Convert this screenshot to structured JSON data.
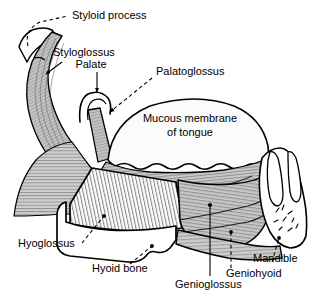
{
  "figure": {
    "background_color": "#ffffff",
    "ink_color": "#000000",
    "muscle_fill": "#c9c9c9",
    "bone_fill": "#ffffff",
    "tongue_fill": "#fbfbfb"
  },
  "labels": {
    "styloid_process": "Styloid process",
    "styloglossus": "Styloglossus",
    "palate": "Palate",
    "palatoglossus": "Palatoglossus",
    "mucous_membrane_line1": "Mucous membrane",
    "mucous_membrane_line2": "of tongue",
    "hyoglossus": "Hyoglossus",
    "hyoid_bone": "Hyoid bone",
    "genioglossus": "Genioglossus",
    "geniohyoid": "Geniohyoid",
    "mandible": "Mandible"
  },
  "leaders": {
    "styloid_process": "dashed",
    "styloglossus": "solid-arrow",
    "palate": "solid-arrow",
    "palatoglossus": "dashed-arrow",
    "mucous_membrane": "none",
    "hyoglossus": "dashed",
    "hyoid_bone": "dashed",
    "genioglossus": "solid",
    "geniohyoid": "dashed",
    "mandible": "dashed"
  }
}
